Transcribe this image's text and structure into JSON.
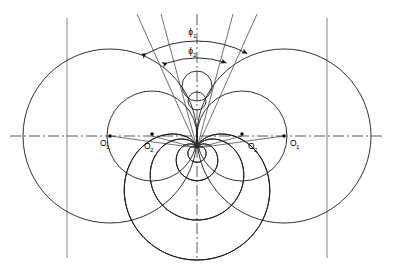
{
  "figure": {
    "title": "",
    "header_faint": "",
    "type": "engineering-construction-diagram"
  },
  "labels": {
    "phi1": "ϕ",
    "phi1_sub": "1",
    "phi2": "ϕ",
    "phi2_sub": "2",
    "o1_left": "O",
    "o1_left_sub": "1",
    "o2_left": "O",
    "o2_left_sub": "2",
    "o2_right": "O",
    "o2_right_sub": "2",
    "o1_right": "O",
    "o1_right_sub": "1"
  },
  "colors": {
    "stroke": "#1a1a1a",
    "construction": "#6e6e6e",
    "axis": "#333333",
    "background": "#ffffff"
  },
  "geometry": {
    "center_x": 197,
    "axis_y": 136,
    "left_vline_x": 67,
    "right_vline_x": 327,
    "o1_left_x": 110,
    "o1_right_x": 284,
    "o2_left_x": 152,
    "o2_right_x": 242,
    "big_circle_radius": 87,
    "small_circle_radius": 45,
    "phi1_deg": 44,
    "phi2_deg": 32
  },
  "chart_data": {
    "type": "scatter",
    "categories": [
      "O1-left",
      "O2-left",
      "O2-right",
      "O1-right"
    ],
    "values": [
      110,
      152,
      242,
      284
    ],
    "xlabel": "",
    "ylabel": "",
    "annotations": [
      "ϕ1",
      "ϕ2"
    ]
  }
}
